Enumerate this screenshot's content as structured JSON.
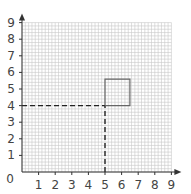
{
  "chart_data": {
    "type": "line",
    "title": "",
    "xlabel": "",
    "ylabel": "",
    "xlim": [
      0,
      9
    ],
    "ylim": [
      0,
      9
    ],
    "x_ticks": [
      "1",
      "2",
      "3",
      "4",
      "5",
      "6",
      "7",
      "8",
      "9"
    ],
    "y_ticks": [
      "1",
      "2",
      "3",
      "4",
      "5",
      "6",
      "7",
      "8",
      "9"
    ],
    "origin_label": "0",
    "grid": true,
    "minor_grid_per_unit": 5,
    "series": [
      {
        "name": "dashed-horizontal-guide",
        "style": "dashed",
        "points": [
          [
            0,
            4
          ],
          [
            5,
            4
          ]
        ]
      },
      {
        "name": "dashed-vertical-guide",
        "style": "dashed",
        "points": [
          [
            5,
            0
          ],
          [
            5,
            4
          ]
        ]
      },
      {
        "name": "square",
        "style": "solid",
        "points": [
          [
            5,
            4
          ],
          [
            6.5,
            4
          ],
          [
            6.5,
            5.6
          ],
          [
            5,
            5.6
          ],
          [
            5,
            4
          ]
        ]
      }
    ],
    "colors": {
      "grid": "#c8c8c8",
      "axis": "#333333",
      "dashed": "#222222",
      "square": "#666666"
    }
  }
}
